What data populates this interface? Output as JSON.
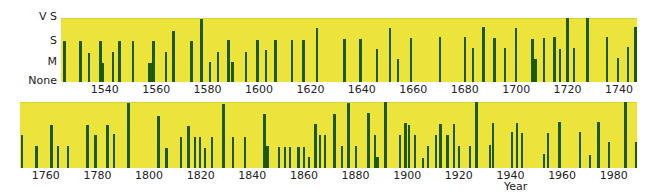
{
  "chart_data": [
    {
      "type": "bar",
      "title": "",
      "xlabel": "",
      "ylabel": "",
      "y_levels": [
        "None",
        "M",
        "S",
        "V S"
      ],
      "y_scale_note": "heights on 0-3 scale: 0=None, 1=M, 2=S, 3=V S",
      "xlim": [
        1523,
        1747
      ],
      "x_ticks": [
        1540,
        1560,
        1580,
        1600,
        1620,
        1640,
        1660,
        1680,
        1700,
        1720,
        1740
      ],
      "grid": false,
      "panel": {
        "left": 61,
        "top": 18,
        "width": 576,
        "height": 63
      },
      "bars": [
        {
          "x": 63,
          "w": 3,
          "top": 40
        },
        {
          "x": 79,
          "w": 3,
          "top": 40
        },
        {
          "x": 88,
          "w": 2,
          "top": 52
        },
        {
          "x": 99,
          "w": 3,
          "top": 40
        },
        {
          "x": 101,
          "w": 3,
          "top": 62
        },
        {
          "x": 112,
          "w": 2,
          "top": 51
        },
        {
          "x": 118,
          "w": 3,
          "top": 40
        },
        {
          "x": 132,
          "w": 2,
          "top": 40
        },
        {
          "x": 148,
          "w": 4,
          "top": 62
        },
        {
          "x": 152,
          "w": 3,
          "top": 40
        },
        {
          "x": 165,
          "w": 2,
          "top": 51
        },
        {
          "x": 172,
          "w": 3,
          "top": 30
        },
        {
          "x": 190,
          "w": 3,
          "top": 40
        },
        {
          "x": 200,
          "w": 3,
          "top": 18
        },
        {
          "x": 209,
          "w": 2,
          "top": 61
        },
        {
          "x": 217,
          "w": 2,
          "top": 51
        },
        {
          "x": 227,
          "w": 3,
          "top": 39
        },
        {
          "x": 231,
          "w": 3,
          "top": 61
        },
        {
          "x": 245,
          "w": 2,
          "top": 51
        },
        {
          "x": 256,
          "w": 3,
          "top": 39
        },
        {
          "x": 265,
          "w": 2,
          "top": 49
        },
        {
          "x": 274,
          "w": 3,
          "top": 39
        },
        {
          "x": 291,
          "w": 2,
          "top": 39
        },
        {
          "x": 302,
          "w": 3,
          "top": 39
        },
        {
          "x": 316,
          "w": 2,
          "top": 27
        },
        {
          "x": 343,
          "w": 3,
          "top": 38
        },
        {
          "x": 359,
          "w": 3,
          "top": 38
        },
        {
          "x": 376,
          "w": 2,
          "top": 48
        },
        {
          "x": 389,
          "w": 2,
          "top": 27
        },
        {
          "x": 397,
          "w": 2,
          "top": 58
        },
        {
          "x": 410,
          "w": 2,
          "top": 37
        },
        {
          "x": 439,
          "w": 2,
          "top": 36
        },
        {
          "x": 464,
          "w": 2,
          "top": 36
        },
        {
          "x": 472,
          "w": 2,
          "top": 47
        },
        {
          "x": 482,
          "w": 3,
          "top": 26
        },
        {
          "x": 493,
          "w": 3,
          "top": 37
        },
        {
          "x": 504,
          "w": 2,
          "top": 47
        },
        {
          "x": 515,
          "w": 2,
          "top": 27
        },
        {
          "x": 531,
          "w": 3,
          "top": 38
        },
        {
          "x": 534,
          "w": 3,
          "top": 58
        },
        {
          "x": 543,
          "w": 2,
          "top": 37
        },
        {
          "x": 553,
          "w": 3,
          "top": 36
        },
        {
          "x": 559,
          "w": 2,
          "top": 48
        },
        {
          "x": 566,
          "w": 3,
          "top": 17
        },
        {
          "x": 573,
          "w": 2,
          "top": 47
        },
        {
          "x": 586,
          "w": 3,
          "top": 17
        },
        {
          "x": 606,
          "w": 2,
          "top": 36
        },
        {
          "x": 617,
          "w": 2,
          "top": 57
        },
        {
          "x": 627,
          "w": 2,
          "top": 46
        },
        {
          "x": 634,
          "w": 3,
          "top": 26
        }
      ]
    },
    {
      "type": "bar",
      "title": "",
      "xlabel": "Year",
      "ylabel": "",
      "xlim": [
        1750,
        1989
      ],
      "x_ticks": [
        1760,
        1780,
        1800,
        1820,
        1840,
        1860,
        1880,
        1900,
        1920,
        1940,
        1960,
        1980
      ],
      "grid": false,
      "panel": {
        "left": 20,
        "top": 102,
        "width": 617,
        "height": 65
      },
      "bars": [
        {
          "x": 21,
          "w": 2,
          "top": 134
        },
        {
          "x": 35,
          "w": 3,
          "top": 145
        },
        {
          "x": 50,
          "w": 3,
          "top": 124
        },
        {
          "x": 57,
          "w": 2,
          "top": 145
        },
        {
          "x": 67,
          "w": 2,
          "top": 145
        },
        {
          "x": 86,
          "w": 3,
          "top": 124
        },
        {
          "x": 94,
          "w": 3,
          "top": 134
        },
        {
          "x": 106,
          "w": 3,
          "top": 124
        },
        {
          "x": 113,
          "w": 2,
          "top": 133
        },
        {
          "x": 127,
          "w": 3,
          "top": 102
        },
        {
          "x": 157,
          "w": 3,
          "top": 115
        },
        {
          "x": 165,
          "w": 3,
          "top": 147
        },
        {
          "x": 180,
          "w": 2,
          "top": 136
        },
        {
          "x": 187,
          "w": 3,
          "top": 125
        },
        {
          "x": 194,
          "w": 2,
          "top": 136
        },
        {
          "x": 199,
          "w": 2,
          "top": 136
        },
        {
          "x": 204,
          "w": 2,
          "top": 147
        },
        {
          "x": 211,
          "w": 2,
          "top": 136
        },
        {
          "x": 222,
          "w": 3,
          "top": 103
        },
        {
          "x": 232,
          "w": 2,
          "top": 136
        },
        {
          "x": 244,
          "w": 2,
          "top": 136
        },
        {
          "x": 263,
          "w": 3,
          "top": 113
        },
        {
          "x": 266,
          "w": 3,
          "top": 145
        },
        {
          "x": 278,
          "w": 2,
          "top": 146
        },
        {
          "x": 284,
          "w": 2,
          "top": 146
        },
        {
          "x": 289,
          "w": 2,
          "top": 146
        },
        {
          "x": 297,
          "w": 3,
          "top": 146
        },
        {
          "x": 303,
          "w": 2,
          "top": 146
        },
        {
          "x": 308,
          "w": 2,
          "top": 156
        },
        {
          "x": 314,
          "w": 3,
          "top": 123
        },
        {
          "x": 319,
          "w": 2,
          "top": 134
        },
        {
          "x": 324,
          "w": 2,
          "top": 134
        },
        {
          "x": 333,
          "w": 3,
          "top": 113
        },
        {
          "x": 341,
          "w": 2,
          "top": 145
        },
        {
          "x": 347,
          "w": 3,
          "top": 102
        },
        {
          "x": 355,
          "w": 2,
          "top": 145
        },
        {
          "x": 367,
          "w": 3,
          "top": 112
        },
        {
          "x": 374,
          "w": 2,
          "top": 134
        },
        {
          "x": 376,
          "w": 3,
          "top": 156
        },
        {
          "x": 384,
          "w": 3,
          "top": 101
        },
        {
          "x": 399,
          "w": 2,
          "top": 134
        },
        {
          "x": 404,
          "w": 3,
          "top": 122
        },
        {
          "x": 408,
          "w": 2,
          "top": 124
        },
        {
          "x": 414,
          "w": 2,
          "top": 134
        },
        {
          "x": 422,
          "w": 2,
          "top": 157
        },
        {
          "x": 427,
          "w": 2,
          "top": 145
        },
        {
          "x": 435,
          "w": 2,
          "top": 134
        },
        {
          "x": 439,
          "w": 3,
          "top": 123
        },
        {
          "x": 446,
          "w": 3,
          "top": 134
        },
        {
          "x": 453,
          "w": 2,
          "top": 123
        },
        {
          "x": 458,
          "w": 2,
          "top": 145
        },
        {
          "x": 469,
          "w": 2,
          "top": 145
        },
        {
          "x": 475,
          "w": 3,
          "top": 101
        },
        {
          "x": 489,
          "w": 2,
          "top": 144
        },
        {
          "x": 492,
          "w": 2,
          "top": 122
        },
        {
          "x": 511,
          "w": 2,
          "top": 131
        },
        {
          "x": 516,
          "w": 2,
          "top": 122
        },
        {
          "x": 521,
          "w": 2,
          "top": 132
        },
        {
          "x": 543,
          "w": 2,
          "top": 153
        },
        {
          "x": 547,
          "w": 2,
          "top": 132
        },
        {
          "x": 558,
          "w": 3,
          "top": 121
        },
        {
          "x": 579,
          "w": 2,
          "top": 131
        },
        {
          "x": 589,
          "w": 2,
          "top": 154
        },
        {
          "x": 597,
          "w": 3,
          "top": 121
        },
        {
          "x": 608,
          "w": 2,
          "top": 141
        },
        {
          "x": 624,
          "w": 3,
          "top": 101
        },
        {
          "x": 635,
          "w": 2,
          "top": 141
        }
      ]
    }
  ],
  "labels": {
    "y_vs": "V S",
    "y_s": "S",
    "y_m": "M",
    "y_none": "None",
    "x_title": "Year"
  },
  "colors": {
    "background": "#ece43a",
    "bar": "#1c5a12"
  }
}
